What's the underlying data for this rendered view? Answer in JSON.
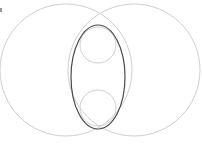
{
  "diagram": {
    "type": "geometric-construction",
    "colors": {
      "background": "#ffffff",
      "light_stroke": "#cfcfcf",
      "dark_stroke": "#4a4a4a"
    },
    "shapes": {
      "left_circle": {
        "cx": 66,
        "cy": 70,
        "r": 66
      },
      "right_circle": {
        "cx": 134,
        "cy": 70,
        "r": 66
      },
      "ellipse": {
        "cx": 98,
        "cy": 77,
        "rx": 27,
        "ry": 52
      },
      "top_small_circle": {
        "cx": 98,
        "cy": 45,
        "r": 18
      },
      "bottom_small_circle": {
        "cx": 98,
        "cy": 108,
        "r": 18
      }
    }
  }
}
